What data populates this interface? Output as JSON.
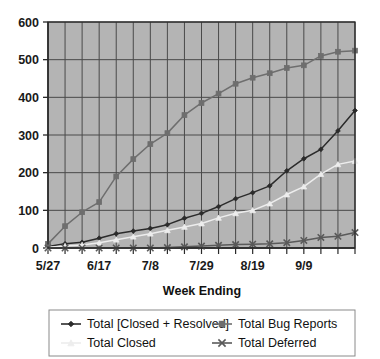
{
  "chart_data": {
    "type": "line",
    "title": "",
    "xlabel": "Week Ending",
    "ylabel": "",
    "ylim": [
      0,
      600
    ],
    "yticks": [
      0,
      100,
      200,
      300,
      400,
      500,
      600
    ],
    "grid": true,
    "legend_position": "bottom",
    "x": [
      "5/27",
      "6/3",
      "6/10",
      "6/17",
      "6/24",
      "7/1",
      "7/8",
      "7/15",
      "7/22",
      "7/29",
      "8/5",
      "8/12",
      "8/19",
      "8/26",
      "9/2",
      "9/9",
      "9/16",
      "9/23",
      "9/30"
    ],
    "xtick_labels_shown": [
      "5/27",
      "6/17",
      "7/8",
      "7/29",
      "8/19",
      "9/9"
    ],
    "xtick_label_interval": 3,
    "series": [
      {
        "name": "Total [Closed + Resolved]",
        "marker": "diamond",
        "color": "#2b2b2b",
        "values": [
          4,
          11,
          15,
          26,
          38,
          45,
          52,
          62,
          79,
          92,
          110,
          131,
          147,
          165,
          205,
          237,
          262,
          311,
          365
        ]
      },
      {
        "name": "Total Bug Reports",
        "marker": "square",
        "color": "#6e6e6e",
        "values": [
          11,
          58,
          95,
          122,
          190,
          236,
          276,
          305,
          353,
          385,
          410,
          436,
          452,
          464,
          478,
          485,
          510,
          521,
          524
        ]
      },
      {
        "name": "Total Closed",
        "marker": "triangle",
        "color": "#ededed",
        "values": [
          2,
          5,
          8,
          14,
          22,
          30,
          38,
          47,
          56,
          65,
          80,
          92,
          100,
          118,
          142,
          163,
          196,
          222,
          231
        ]
      },
      {
        "name": "Total Deferred",
        "marker": "cross",
        "color": "#5a5a5a",
        "values": [
          0,
          0,
          0,
          0,
          0,
          0,
          0,
          1,
          3,
          5,
          7,
          9,
          10,
          11,
          14,
          20,
          28,
          31,
          41
        ]
      }
    ]
  },
  "legend": {
    "entries": [
      {
        "label": "Total [Closed + Resolved]",
        "marker": "diamond",
        "color": "#2b2b2b"
      },
      {
        "label": "Total Bug Reports",
        "marker": "square",
        "color": "#6e6e6e"
      },
      {
        "label": "Total Closed",
        "marker": "triangle",
        "color": "#ededed"
      },
      {
        "label": "Total Deferred",
        "marker": "cross",
        "color": "#5a5a5a"
      }
    ]
  },
  "style": {
    "plot_background": "#b4b4b4",
    "gridline_color": "#4a4a4a",
    "axis_color": "#2a2a2a",
    "page_background": "#ffffff"
  }
}
